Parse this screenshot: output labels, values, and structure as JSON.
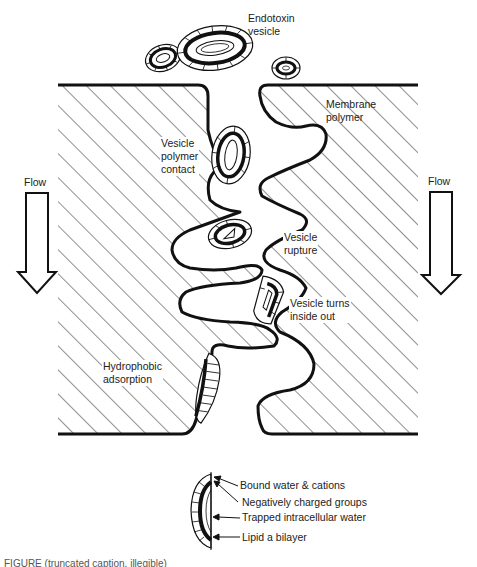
{
  "diagram": {
    "type": "schematic"
  },
  "labels": {
    "endotoxin_vesicle": "Endotoxin\nvesicle",
    "membrane_polymer": "Membrane\npolymer",
    "vesicle_polymer_contact": "Vesicle\npolymer\ncontact",
    "vesicle_rupture": "Vesicle\nrupture",
    "vesicle_turns_inside_out": "Vesicle turns\ninside out",
    "hydrophobic_adsorption": "Hydrophobic\nadsorption",
    "flow_left": "Flow",
    "flow_right": "Flow"
  },
  "legend": {
    "items": [
      "Bound water & cations",
      "Negatively charged groups",
      "Trapped intracellular water",
      "Lipid a bilayer"
    ]
  },
  "caption": {
    "text": "FIGURE (truncated caption, illegible)"
  },
  "colors": {
    "line": "#111111",
    "hatch": "#333333",
    "background": "#ffffff"
  }
}
